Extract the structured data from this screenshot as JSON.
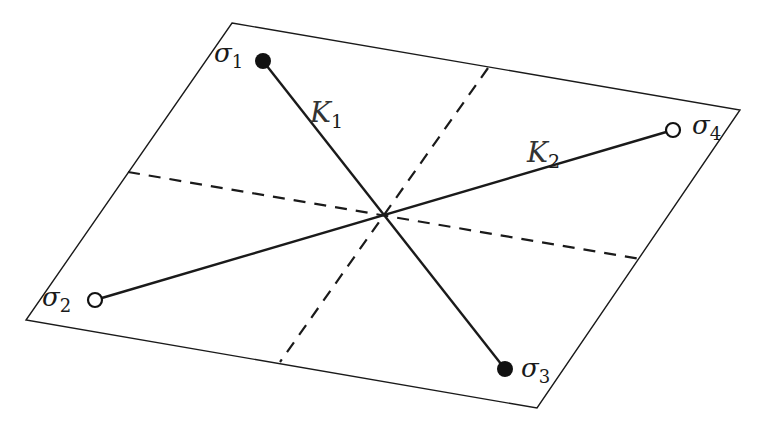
{
  "diagram": {
    "plane": {
      "corners": [
        [
          232,
          23
        ],
        [
          740,
          110
        ],
        [
          537,
          408
        ],
        [
          26,
          320
        ]
      ],
      "stroke": "#1a1a1a"
    },
    "center": [
      382,
      215
    ],
    "dashed_lines": [
      {
        "from": [
          488,
          68
        ],
        "to": [
          280,
          362
        ]
      },
      {
        "from": [
          128,
          172
        ],
        "to": [
          640,
          259
        ]
      }
    ],
    "segments": [
      {
        "label": "K",
        "sub": "1",
        "from": [
          263,
          61
        ],
        "to": [
          505,
          369
        ],
        "label_pos": [
          310,
          122
        ]
      },
      {
        "label": "K",
        "sub": "2",
        "from": [
          95,
          300
        ],
        "to": [
          673,
          130
        ],
        "label_pos": [
          527,
          162
        ]
      }
    ],
    "points": [
      {
        "id": "sigma1",
        "label": "σ",
        "sub": "1",
        "pos": [
          263,
          61
        ],
        "filled": true,
        "label_pos": [
          215,
          66
        ]
      },
      {
        "id": "sigma2",
        "label": "σ",
        "sub": "2",
        "pos": [
          95,
          300
        ],
        "filled": false,
        "label_pos": [
          44,
          310
        ]
      },
      {
        "id": "sigma3",
        "label": "σ",
        "sub": "3",
        "pos": [
          505,
          369
        ],
        "filled": true,
        "label_pos": [
          522,
          380
        ]
      },
      {
        "id": "sigma4",
        "label": "σ",
        "sub": "4",
        "pos": [
          673,
          130
        ],
        "filled": false,
        "label_pos": [
          693,
          137
        ]
      }
    ]
  },
  "labels": {
    "k1": "K",
    "k1_sub": "1",
    "k2": "K",
    "k2_sub": "2",
    "s1": "σ",
    "s1_sub": "1",
    "s2": "σ",
    "s2_sub": "2",
    "s3": "σ",
    "s3_sub": "3",
    "s4": "σ",
    "s4_sub": "4"
  }
}
